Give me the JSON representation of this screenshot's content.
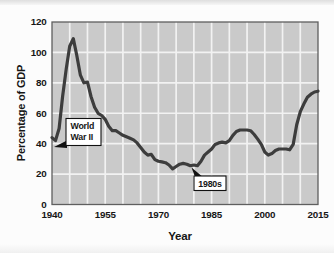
{
  "chart_data": {
    "type": "line",
    "title": "",
    "xlabel": "Year",
    "ylabel": "Percentage of GDP",
    "xlim": [
      1940,
      2015
    ],
    "ylim": [
      0,
      120
    ],
    "x_ticks": [
      1940,
      1955,
      1970,
      1985,
      2000,
      2015
    ],
    "y_ticks": [
      0,
      20,
      40,
      60,
      80,
      100,
      120
    ],
    "grid": {
      "on": true,
      "x_step_years": 5,
      "y_step": 20
    },
    "legend": "none",
    "series": [
      {
        "years": [
          1940,
          1941,
          1942,
          1943,
          1944,
          1945,
          1946,
          1947,
          1948,
          1949,
          1950,
          1951,
          1952,
          1953,
          1954,
          1955,
          1956,
          1957,
          1958,
          1959,
          1960,
          1961,
          1962,
          1963,
          1964,
          1965,
          1966,
          1967,
          1968,
          1969,
          1970,
          1971,
          1972,
          1973,
          1974,
          1975,
          1976,
          1977,
          1978,
          1979,
          1980,
          1981,
          1982,
          1983,
          1984,
          1985,
          1986,
          1987,
          1988,
          1989,
          1990,
          1991,
          1992,
          1993,
          1994,
          1995,
          1996,
          1997,
          1998,
          1999,
          2000,
          2001,
          2002,
          2003,
          2004,
          2005,
          2006,
          2007,
          2008,
          2009,
          2010,
          2011,
          2012,
          2013,
          2014,
          2015
        ],
        "values": [
          44,
          42,
          50,
          71,
          89,
          104,
          109,
          98,
          85,
          80,
          80.5,
          71,
          64,
          60,
          58.5,
          56,
          51.5,
          48.5,
          48.5,
          47,
          45.5,
          44.5,
          43.5,
          42.5,
          40.5,
          37.5,
          34.5,
          32.5,
          33,
          29.5,
          28.5,
          28,
          27.5,
          26,
          23.5,
          25,
          26.5,
          27,
          26.5,
          25.5,
          26,
          25.5,
          28.5,
          32.5,
          34.5,
          36.5,
          39.5,
          40.5,
          41,
          40.5,
          42,
          45.5,
          48,
          49,
          49,
          49,
          48.5,
          46,
          43,
          39.5,
          34.5,
          32.5,
          33.5,
          35.5,
          36.5,
          36.5,
          36.5,
          36,
          39.5,
          52.5,
          61,
          66,
          70.5,
          72.5,
          74,
          74.5
        ]
      }
    ],
    "annotations": [
      {
        "lines": [
          "World",
          "War II"
        ],
        "target_year": 1941,
        "target_value": 42
      },
      {
        "lines": [
          "1980s"
        ],
        "target_year": 1981,
        "target_value": 26
      }
    ],
    "colors": {
      "plot_background": "#cacaca",
      "gridline": "#f2f2f2",
      "line": "#3d3d3d",
      "plot_border": "#5f5f5f",
      "callout_fill": "#ffffff",
      "callout_border": "#111111",
      "text": "#161616"
    }
  }
}
